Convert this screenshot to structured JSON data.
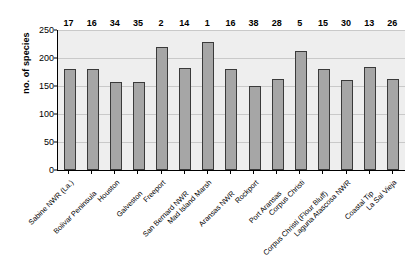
{
  "chart_data": {
    "type": "bar",
    "title": "",
    "xlabel": "",
    "ylabel": "no. of species",
    "ylim": [
      0,
      250
    ],
    "yticks": [
      0,
      50,
      100,
      150,
      200,
      250
    ],
    "grid": true,
    "legend": "none",
    "categories": [
      "Sabine NWR (La.)",
      "Bolivar Peninsula",
      "Houston",
      "Galveston",
      "Freeport",
      "San Bernard NWR",
      "Mad Island Marsh",
      "Aransas NWR",
      "Rockport",
      "Port Aransas",
      "Corpus Christi",
      "Corpus Christi (Flour Bluff)",
      "Laguna Atascosa NWR",
      "Coastal Tip",
      "La Sal Vieja"
    ],
    "values": [
      180,
      180,
      158,
      157,
      220,
      182,
      229,
      180,
      150,
      163,
      212,
      180,
      161,
      184,
      163
    ],
    "point_labels": [
      17,
      16,
      34,
      35,
      2,
      14,
      1,
      16,
      38,
      28,
      5,
      15,
      30,
      13,
      26
    ],
    "colors": {
      "bar_fill": "#a6a6a6",
      "bar_stroke": "#3a3a3a",
      "plot_background": "#eeeeee",
      "gridline": "#c9c9c9",
      "axis": "#000000",
      "text": "#000000"
    }
  }
}
